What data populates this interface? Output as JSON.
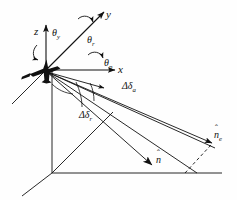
{
  "figure": {
    "background_color": "#fefefe",
    "line_color": "#111111",
    "watermark_color": "#ededed"
  },
  "axes": [
    {
      "name": "z-axis",
      "label": "z",
      "direction": "up"
    },
    {
      "name": "y-axis",
      "label": "y",
      "direction": "upper-right"
    },
    {
      "name": "x-axis",
      "label": "x",
      "direction": "right"
    }
  ],
  "rotation_angles": [
    {
      "name": "yaw",
      "label_base": "θ",
      "subscript": "y",
      "about_axis": "z"
    },
    {
      "name": "roll",
      "label_base": "θ",
      "subscript": "r",
      "about_axis": "y"
    },
    {
      "name": "pitch",
      "label_base": "θ",
      "subscript": "p",
      "about_axis": "x"
    }
  ],
  "beam_offsets": [
    {
      "name": "azimuth-offset",
      "label_base": "Δδ",
      "subscript": "a"
    },
    {
      "name": "range-offset",
      "label_base": "Δδ",
      "subscript": "r"
    }
  ],
  "vectors": [
    {
      "name": "nominal-pointing-vector",
      "label_base": "n",
      "subscript": "",
      "accent": "ˆ"
    },
    {
      "name": "effective-pointing-vector",
      "label_base": "n",
      "subscript": "e",
      "accent": "ˆ"
    }
  ],
  "ground_frame": {
    "name": "ground-reference-frame",
    "description": "vertical, horizontal and oblique reference lines forming the ground coordinate frame"
  },
  "glyphs": {
    "theta": "θ",
    "delta_cap": "Δ",
    "delta_low": "δ",
    "hat": "ˆ",
    "n": "n",
    "x": "x",
    "y": "y",
    "z": "z",
    "sub_y": "y",
    "sub_r": "r",
    "sub_p": "p",
    "sub_a": "a",
    "sub_e": "e"
  },
  "watermark": {
    "visible": true,
    "lines": [
      "",
      "",
      "",
      ""
    ]
  }
}
